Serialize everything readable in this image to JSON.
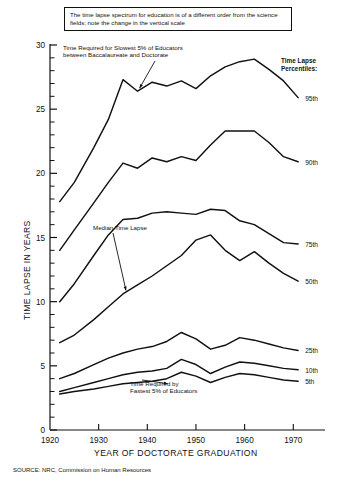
{
  "figure": {
    "callout": "The time lapse spectrum for education is of a different order from the science fields; note the change in the vertical scale",
    "source": "SOURCE: NRC, Commission on Human Resources",
    "legend_heading_line1": "Time Lapse",
    "legend_heading_line2": "Percentiles:",
    "annotation_top_line1": "Time Required for Slowest 5% of Educators",
    "annotation_top_line2": "between Baccalaureate and Doctorate",
    "annotation_mid": "Median Time Lapse",
    "annotation_bottom_line1": "Time Required by",
    "annotation_bottom_line2": "Fastest 5% of Educators"
  },
  "chart_data": {
    "type": "line",
    "title": "The time lapse spectrum for education is of a different order from the science fields; note the change in the vertical scale",
    "xlabel": "YEAR OF DOCTORATE GRADUATION",
    "ylabel": "TIME LAPSE IN YEARS",
    "xlim": [
      1920,
      1972
    ],
    "ylim": [
      0,
      30
    ],
    "xticks": [
      1920,
      1930,
      1940,
      1950,
      1960,
      1970
    ],
    "xticklabels": [
      "1920",
      "1930",
      "1940",
      "1950",
      "1960",
      "1970"
    ],
    "yticks": [
      0,
      5,
      10,
      15,
      20,
      25,
      30
    ],
    "yticklabels": [
      "0",
      "5",
      "10",
      "15",
      "20",
      "25",
      "30"
    ],
    "y_minor_tick_step": 1,
    "grid": false,
    "legend_position": "right",
    "line_color": "#111111",
    "x": [
      1922,
      1925,
      1929,
      1932,
      1935,
      1938,
      1941,
      1944,
      1947,
      1950,
      1953,
      1956,
      1959,
      1962,
      1965,
      1968,
      1971
    ],
    "series": [
      {
        "name": "95th",
        "label": "95th",
        "values": [
          17.8,
          19.3,
          22.0,
          24.2,
          27.3,
          26.4,
          27.1,
          26.8,
          27.2,
          26.6,
          27.6,
          28.3,
          28.7,
          28.9,
          28.1,
          27.2,
          25.9
        ]
      },
      {
        "name": "90th",
        "label": "90th",
        "values": [
          14.0,
          15.6,
          17.7,
          19.3,
          20.8,
          20.4,
          21.2,
          20.9,
          21.3,
          21.0,
          22.2,
          23.3,
          23.3,
          23.3,
          22.4,
          21.3,
          20.9
        ]
      },
      {
        "name": "75th",
        "label": "75th",
        "values": [
          10.0,
          11.4,
          13.6,
          15.2,
          16.4,
          16.5,
          16.9,
          17.0,
          16.9,
          16.8,
          17.2,
          17.1,
          16.3,
          16.0,
          15.3,
          14.6,
          14.5
        ]
      },
      {
        "name": "50th",
        "label": "50th",
        "values": [
          6.8,
          7.4,
          8.6,
          9.6,
          10.6,
          11.3,
          12.0,
          12.8,
          13.6,
          14.8,
          15.2,
          14.0,
          13.2,
          13.9,
          13.0,
          12.2,
          11.6
        ]
      },
      {
        "name": "25th",
        "label": "25th",
        "values": [
          4.0,
          4.4,
          5.1,
          5.6,
          6.0,
          6.3,
          6.5,
          6.9,
          7.6,
          7.1,
          6.3,
          6.6,
          7.2,
          7.0,
          6.7,
          6.4,
          6.2
        ]
      },
      {
        "name": "10th",
        "label": "10th",
        "values": [
          3.0,
          3.3,
          3.7,
          4.0,
          4.3,
          4.5,
          4.6,
          4.8,
          5.5,
          5.1,
          4.4,
          4.9,
          5.3,
          5.2,
          5.0,
          4.8,
          4.7
        ]
      },
      {
        "name": "5th",
        "label": "5th",
        "values": [
          2.8,
          3.0,
          3.2,
          3.4,
          3.6,
          3.7,
          3.8,
          4.0,
          4.5,
          4.2,
          3.7,
          4.1,
          4.4,
          4.3,
          4.1,
          3.9,
          3.8
        ]
      }
    ],
    "annotations": [
      {
        "text": "Time Required for Slowest 5% of Educators between Baccalaureate and Doctorate",
        "points_to_series": "95th",
        "points_to_x": 1938
      },
      {
        "text": "Median Time Lapse",
        "points_to_series": "50th",
        "points_to_x": 1935
      },
      {
        "text": "Time Required by Fastest 5% of Educators",
        "points_to_series": "5th",
        "points_to_x": 1944
      }
    ]
  }
}
